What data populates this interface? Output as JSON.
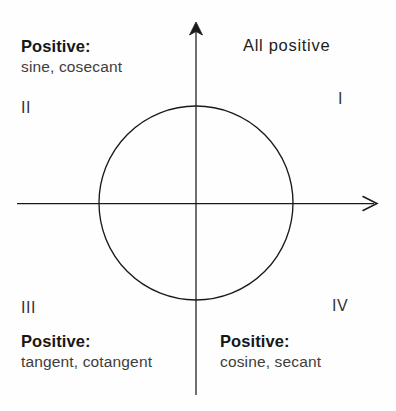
{
  "figure": {
    "type": "unit-circle-quadrant-sign-diagram",
    "width": 396,
    "height": 411,
    "background_color": "#fefefe",
    "stroke_color": "#1a1a1a"
  },
  "axes": {
    "origin": {
      "x": 196,
      "y": 203
    },
    "vertical": {
      "x": 196,
      "y_top": 22,
      "y_bottom": 395,
      "arrow": "up"
    },
    "horizontal": {
      "y": 203,
      "x_left": 17,
      "x_right": 378,
      "arrow": "right"
    }
  },
  "circle": {
    "center_x": 196,
    "center_y": 203,
    "radius": 97
  },
  "quadrants": {
    "q1": {
      "numeral": "I",
      "text": "All positive",
      "head": "",
      "body": ""
    },
    "q2": {
      "numeral": "II",
      "head": "Positive:",
      "body": "sine, cosecant"
    },
    "q3": {
      "numeral": "III",
      "head": "Positive:",
      "body": "tangent, cotangent"
    },
    "q4": {
      "numeral": "IV",
      "head": "Positive:",
      "body": "cosine, secant"
    }
  }
}
